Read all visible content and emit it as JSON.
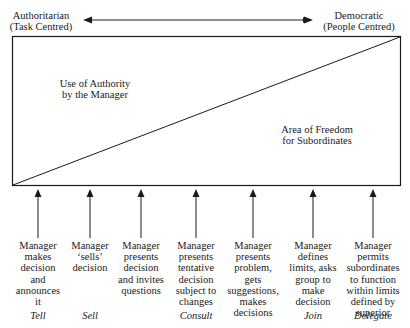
{
  "title_axis": {
    "left_label": [
      "Authoritarian",
      "(Task Centred)"
    ],
    "right_label": [
      "Democratic",
      "(People Centred)"
    ]
  },
  "regions": {
    "upper_left": [
      "Use of Authority",
      "by the Manager"
    ],
    "lower_right": [
      "Area of Freedom",
      "for Subordinates"
    ]
  },
  "behaviours": [
    {
      "x": 38,
      "lines": [
        "Manager",
        "makes",
        "decision",
        "and",
        "announces",
        "it"
      ],
      "style": "Tell"
    },
    {
      "x": 90,
      "lines": [
        "Manager",
        "‘sells’",
        "decision"
      ],
      "style": "Sell"
    },
    {
      "x": 141,
      "lines": [
        "Manager",
        "presents",
        "decision",
        "and invites",
        "questions"
      ],
      "style": ""
    },
    {
      "x": 196,
      "lines": [
        "Manager",
        "presents",
        "tentative",
        "decision",
        "subject to",
        "changes"
      ],
      "style": "Consult"
    },
    {
      "x": 253,
      "lines": [
        "Manager",
        "presents",
        "problem,",
        "gets",
        "suggestions,",
        "makes",
        "decisions"
      ],
      "style": ""
    },
    {
      "x": 313,
      "lines": [
        "Manager",
        "defines",
        "limits, asks",
        "group to",
        "make",
        "decision"
      ],
      "style": "Join"
    },
    {
      "x": 373,
      "lines": [
        "Manager",
        "permits",
        "subordinates",
        "to function",
        "within limits",
        "defined by",
        "superior"
      ],
      "style": "Delegate"
    }
  ],
  "colors": {
    "line": "#1a1a1a",
    "background": "#ffffff"
  }
}
